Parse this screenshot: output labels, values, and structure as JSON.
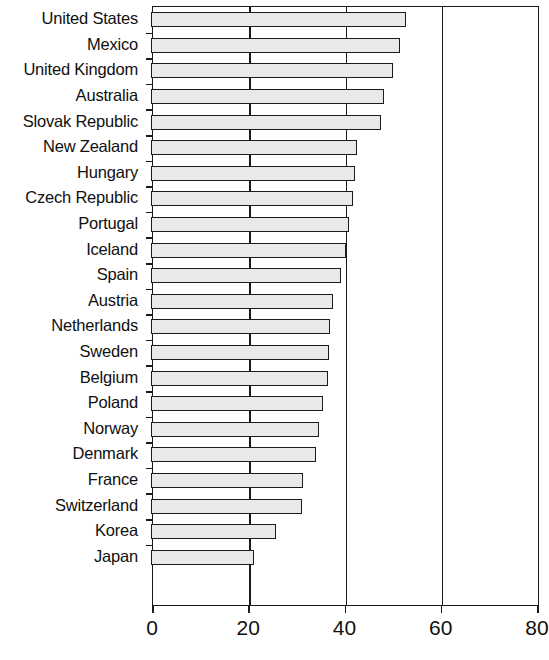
{
  "chart_data": {
    "type": "bar",
    "orientation": "horizontal",
    "title": "",
    "subtitle": "",
    "xlabel": "",
    "ylabel": "",
    "xlim": [
      0,
      80
    ],
    "xticks": [
      0,
      20,
      40,
      60,
      80
    ],
    "xtick_labels": [
      "0",
      "20",
      "40",
      "60",
      "80"
    ],
    "grid": "vertical gridlines at 20, 40, 60",
    "legend": "none",
    "bar_fill_color": "#e9e9e9",
    "bar_edge_color": "#1c1c1c",
    "categories": [
      "United States",
      "Mexico",
      "United Kingdom",
      "Australia",
      "Slovak Republic",
      "New Zealand",
      "Hungary",
      "Czech Republic",
      "Portugal",
      "Iceland",
      "Spain",
      "Austria",
      "Netherlands",
      "Sweden",
      "Belgium",
      "Poland",
      "Norway",
      "Denmark",
      "France",
      "Switzerland",
      "Korea",
      "Japan"
    ],
    "values": [
      52.6,
      51.3,
      49.9,
      48.0,
      47.4,
      42.4,
      42.0,
      41.6,
      40.8,
      40.0,
      39.0,
      37.4,
      36.8,
      36.6,
      36.4,
      35.3,
      34.5,
      33.9,
      31.2,
      31.0,
      25.6,
      21.0
    ]
  }
}
